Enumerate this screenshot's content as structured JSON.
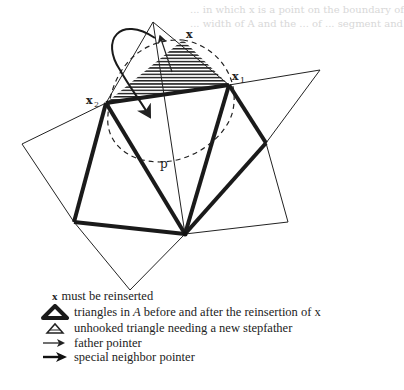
{
  "figure": {
    "labels": {
      "x": "x",
      "x1_base": "x",
      "x1_sub": "1",
      "x2_base": "x",
      "x2_sub": "2",
      "p": "p"
    },
    "background_text_faded": [
      "... in which x is a point on the boundary of",
      "... width of A and the ... of ... segment and"
    ]
  },
  "legend": {
    "items": [
      {
        "icon": "x-marker",
        "symbol": "x",
        "label": "must be reinserted"
      },
      {
        "icon": "thick-triangle-icon",
        "label_pre": "triangles in ",
        "label_italic": "A",
        "label_post": " before and after the reinsertion of x"
      },
      {
        "icon": "hatched-triangle-icon",
        "label": "unhooked triangle needing a new stepfather"
      },
      {
        "icon": "father-arrow-icon",
        "label": "father pointer"
      },
      {
        "icon": "special-neighbor-arrow-icon",
        "label": "special neighbor pointer"
      }
    ]
  },
  "colors": {
    "ink": "#1a1a1a",
    "background": "#ffffff",
    "faded_text": "#d8d8d8"
  }
}
